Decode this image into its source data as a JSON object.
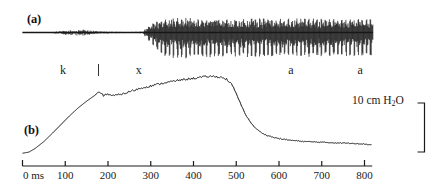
{
  "figure": {
    "panels": [
      {
        "id": "a",
        "label": "(a)",
        "description": "acoustic-waveform"
      },
      {
        "id": "b",
        "label": "(b)",
        "description": "subglottal-pressure-trace"
      }
    ],
    "segment_labels": [
      {
        "text": "k",
        "time_ms": 95
      },
      {
        "text": "|",
        "time_ms": 178
      },
      {
        "text": "x",
        "time_ms": 272
      },
      {
        "text": "a",
        "time_ms": 628
      },
      {
        "text": "a",
        "time_ms": 790
      }
    ],
    "scalebar": {
      "value": "10",
      "unit_pre": " cm H",
      "unit_sub": "2",
      "unit_post": "O",
      "full_text": "10 cm H2O",
      "top_ms_y": 103,
      "bottom_y": 152
    },
    "axis": {
      "label_unit": "ms",
      "first_tick_text": "0 ms",
      "ticks": [
        0,
        100,
        200,
        300,
        400,
        500,
        600,
        700,
        800
      ],
      "tick_labels": [
        "0 ms",
        "100",
        "200",
        "300",
        "400",
        "500",
        "600",
        "700",
        "800"
      ],
      "xlim": [
        0,
        820
      ]
    }
  },
  "chart_data": {
    "type": "line",
    "title": "",
    "xlabel": "ms",
    "ylabel": "",
    "xlim": [
      0,
      820
    ],
    "grid": false,
    "legend": "none",
    "series": [
      {
        "name": "acoustic waveform",
        "panel": "a",
        "type": "waveform-envelope",
        "xlabel": "time (ms)",
        "ylabel": "amplitude",
        "envelope_x": [
          0,
          60,
          100,
          140,
          175,
          195,
          215,
          240,
          262,
          282,
          300,
          330,
          360,
          400,
          440,
          480,
          520,
          560,
          600,
          640,
          680,
          720,
          760,
          800,
          820
        ],
        "envelope_top": [
          0.02,
          0.02,
          0.2,
          0.3,
          0.12,
          0.1,
          0.07,
          0.05,
          0.06,
          0.1,
          0.55,
          0.92,
          1.0,
          0.95,
          0.92,
          0.93,
          0.95,
          0.92,
          0.9,
          0.92,
          0.93,
          0.9,
          0.92,
          0.9,
          0.88
        ],
        "envelope_bottom": [
          0.02,
          0.02,
          0.2,
          0.3,
          0.12,
          0.1,
          0.07,
          0.05,
          0.06,
          0.1,
          0.7,
          1.55,
          1.75,
          1.7,
          1.62,
          1.6,
          1.62,
          1.58,
          1.55,
          1.58,
          1.6,
          1.55,
          1.58,
          1.55,
          1.5
        ]
      },
      {
        "name": "subglottal pressure",
        "panel": "b",
        "type": "line",
        "xlabel": "time (ms)",
        "ylabel": "pressure (cm H2O)",
        "x": [
          0,
          15,
          30,
          50,
          70,
          90,
          110,
          130,
          150,
          165,
          178,
          190,
          200,
          212,
          225,
          240,
          255,
          270,
          290,
          310,
          330,
          350,
          370,
          390,
          410,
          430,
          450,
          465,
          478,
          490,
          500,
          512,
          525,
          540,
          555,
          570,
          590,
          610,
          630,
          660,
          690,
          720,
          750,
          780,
          800,
          815
        ],
        "y": [
          0.3,
          0.45,
          0.95,
          1.85,
          2.95,
          4.1,
          5.25,
          6.3,
          7.2,
          7.8,
          8.3,
          7.95,
          8.15,
          7.9,
          8.05,
          8.25,
          8.55,
          8.8,
          9.1,
          9.35,
          9.6,
          9.8,
          10.0,
          10.15,
          10.3,
          10.45,
          10.48,
          10.35,
          10.1,
          9.35,
          8.2,
          6.6,
          5.1,
          3.9,
          3.15,
          2.7,
          2.35,
          2.15,
          2.0,
          1.85,
          1.78,
          1.7,
          1.65,
          1.6,
          1.52,
          1.42
        ]
      }
    ]
  },
  "colors": {
    "trace": "#1a1a1a",
    "background": "#ffffff",
    "axis": "#1a1a1a"
  }
}
